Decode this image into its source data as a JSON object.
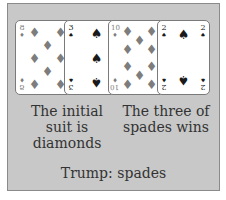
{
  "cards": [
    {
      "rank": "8",
      "suit": "diamonds",
      "glyph": "♦",
      "color": "#7d7d7d"
    },
    {
      "rank": "3",
      "suit": "spades",
      "glyph": "♠",
      "color": "#1a1a1a"
    },
    {
      "rank": "10",
      "suit": "diamonds",
      "glyph": "♦",
      "color": "#7d7d7d"
    },
    {
      "rank": "2",
      "suit": "spades",
      "glyph": "♠",
      "color": "#1a1a1a"
    }
  ],
  "captions": {
    "left": "The initial suit is diamonds",
    "right": "The three of spades wins"
  },
  "footer": {
    "trump": "Trump: spades"
  },
  "colors": {
    "panel_bg": "#c8c8c8",
    "panel_border": "#8a8a8a",
    "diamonds": "#7d7d7d",
    "spades": "#1a1a1a",
    "text": "#333333"
  }
}
